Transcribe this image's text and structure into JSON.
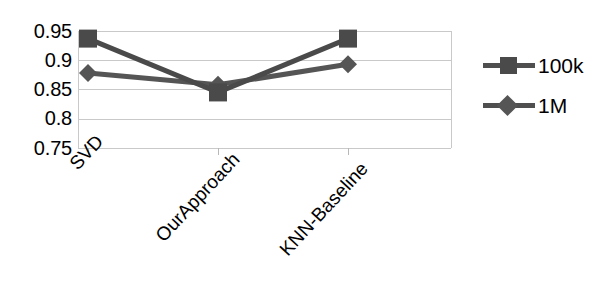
{
  "chart_data": {
    "type": "line",
    "title": "",
    "xlabel": "",
    "ylabel": "",
    "categories": [
      "SVD",
      "OurApproach",
      "KNN-Baseline"
    ],
    "series": [
      {
        "name": "100k",
        "marker": "square",
        "color": "#4a4a4a",
        "values": [
          0.937,
          0.845,
          0.937
        ]
      },
      {
        "name": "1M",
        "marker": "diamond",
        "color": "#555555",
        "values": [
          0.878,
          0.858,
          0.893
        ]
      }
    ],
    "ylim": [
      0.75,
      0.95
    ],
    "yticks": [
      "0.95",
      "0.9",
      "0.85",
      "0.8",
      "0.75"
    ],
    "ytick_values": [
      0.95,
      0.9,
      0.85,
      0.8,
      0.75
    ],
    "grid": true,
    "grid_color": "#c9c9c9",
    "legend_position": "right",
    "legend": [
      {
        "label": "100k",
        "marker": "square"
      },
      {
        "label": "1M",
        "marker": "diamond"
      }
    ]
  }
}
